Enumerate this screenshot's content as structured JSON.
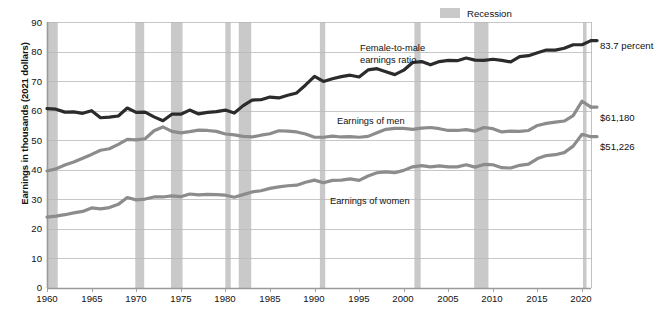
{
  "chart_data": {
    "type": "line",
    "title": "",
    "xlabel": "",
    "ylabel": "Earnings in thousands (2021 dollars)",
    "xlim": [
      1960,
      2021
    ],
    "ylim": [
      0,
      90
    ],
    "ytick_step": 10,
    "xtick_step": 5,
    "grid": true,
    "legend_position": "top-center",
    "yticks": [
      "0",
      "10",
      "20",
      "30",
      "40",
      "50",
      "60",
      "70",
      "80",
      "90"
    ],
    "xticks": [
      "1960",
      "1965",
      "1970",
      "1975",
      "1980",
      "1985",
      "1990",
      "1995",
      "2000",
      "2005",
      "2010",
      "2015",
      "2020"
    ],
    "legend": [
      {
        "label": "Recession",
        "color": "#c9c9c9",
        "kind": "band"
      }
    ],
    "annotations": [
      {
        "text_line1": "Female-to-male",
        "text_line2": "earnings ratio",
        "series": "ratio"
      },
      {
        "text_line1": "Earnings of men",
        "text_line2": "",
        "series": "men"
      },
      {
        "text_line1": "Earnings of women",
        "text_line2": "",
        "series": "women"
      }
    ],
    "end_labels": [
      {
        "text": "83.7 percent",
        "series": "ratio",
        "value": 83.7
      },
      {
        "text": "$61,180",
        "series": "men",
        "value": 61.18
      },
      {
        "text": "$51,226",
        "series": "women",
        "value": 51.226
      }
    ],
    "recessions": [
      [
        1960.0,
        1961.2
      ],
      [
        1969.9,
        1970.9
      ],
      [
        1973.9,
        1975.2
      ],
      [
        1980.0,
        1980.6
      ],
      [
        1981.5,
        1982.9
      ],
      [
        1990.6,
        1991.2
      ],
      [
        2001.2,
        2001.9
      ],
      [
        2007.9,
        2009.5
      ],
      [
        2020.1,
        2020.5
      ]
    ],
    "x": [
      1960,
      1961,
      1962,
      1963,
      1964,
      1965,
      1966,
      1967,
      1968,
      1969,
      1970,
      1971,
      1972,
      1973,
      1974,
      1975,
      1976,
      1977,
      1978,
      1979,
      1980,
      1981,
      1982,
      1983,
      1984,
      1985,
      1986,
      1987,
      1988,
      1989,
      1990,
      1991,
      1992,
      1993,
      1994,
      1995,
      1996,
      1997,
      1998,
      1999,
      2000,
      2001,
      2002,
      2003,
      2004,
      2005,
      2006,
      2007,
      2008,
      2009,
      2010,
      2011,
      2012,
      2013,
      2014,
      2015,
      2016,
      2017,
      2018,
      2019,
      2020,
      2021
    ],
    "series": [
      {
        "name": "Female-to-male earnings ratio",
        "units": "percent",
        "color": "#2b2b2b",
        "linewidth": 3.2,
        "values": [
          60.7,
          60.5,
          59.5,
          59.6,
          59.1,
          60.0,
          57.6,
          57.8,
          58.2,
          60.9,
          59.4,
          59.5,
          57.9,
          56.6,
          58.8,
          58.8,
          60.2,
          58.9,
          59.4,
          59.7,
          60.2,
          59.2,
          61.7,
          63.6,
          63.7,
          64.6,
          64.3,
          65.2,
          66.0,
          68.7,
          71.6,
          69.9,
          70.8,
          71.5,
          72.0,
          71.4,
          73.8,
          74.2,
          73.2,
          72.2,
          73.7,
          76.3,
          76.6,
          75.5,
          76.6,
          77.0,
          76.9,
          77.8,
          77.1,
          77.0,
          77.4,
          77.0,
          76.5,
          78.3,
          78.6,
          79.6,
          80.5,
          80.5,
          81.1,
          82.3,
          82.3,
          83.7
        ]
      },
      {
        "name": "Earnings of men",
        "units": "thousands of 2021 dollars",
        "color": "#8c8c8c",
        "linewidth": 3.2,
        "values": [
          39.6,
          40.3,
          41.6,
          42.6,
          43.9,
          45.2,
          46.6,
          47.1,
          48.6,
          50.3,
          50.1,
          50.5,
          53.2,
          54.5,
          53.0,
          52.5,
          52.9,
          53.4,
          53.3,
          53.0,
          52.1,
          51.8,
          51.3,
          51.1,
          51.7,
          52.2,
          53.2,
          53.1,
          52.8,
          52.1,
          51.0,
          51.0,
          51.4,
          51.1,
          51.2,
          51.0,
          51.3,
          52.5,
          53.7,
          54.0,
          54.0,
          53.7,
          54.1,
          54.3,
          53.9,
          53.3,
          53.3,
          53.6,
          53.1,
          54.3,
          53.9,
          52.8,
          53.1,
          53.0,
          53.3,
          55.0,
          55.7,
          56.1,
          56.5,
          58.3,
          63.2,
          61.2
        ]
      },
      {
        "name": "Earnings of women",
        "units": "thousands of 2021 dollars",
        "color": "#8c8c8c",
        "linewidth": 3.2,
        "values": [
          24.0,
          24.3,
          24.8,
          25.4,
          25.9,
          27.1,
          26.8,
          27.2,
          28.3,
          30.6,
          29.8,
          30.1,
          30.8,
          30.8,
          31.2,
          30.9,
          31.8,
          31.5,
          31.7,
          31.6,
          31.4,
          30.7,
          31.6,
          32.5,
          32.9,
          33.7,
          34.2,
          34.6,
          34.8,
          35.8,
          36.5,
          35.6,
          36.4,
          36.5,
          36.9,
          36.4,
          37.9,
          39.0,
          39.3,
          39.0,
          39.8,
          41.0,
          41.4,
          41.0,
          41.3,
          41.0,
          41.0,
          41.7,
          40.9,
          41.8,
          41.7,
          40.7,
          40.6,
          41.5,
          41.9,
          43.8,
          44.8,
          45.1,
          45.8,
          48.0,
          52.0,
          51.2
        ]
      }
    ]
  },
  "labels": {
    "recession_legend": "Recession",
    "ratio_anno_1": "Female-to-male",
    "ratio_anno_2": "earnings ratio",
    "men_anno": "Earnings of men",
    "women_anno": "Earnings of women",
    "end_ratio": "83.7 percent",
    "end_men": "$61,180",
    "end_women": "$51,226",
    "yaxis_title": "Earnings in thousands (2021 dollars)",
    "y0": "0",
    "y10": "10",
    "y20": "20",
    "y30": "30",
    "y40": "40",
    "y50": "50",
    "y60": "60",
    "y70": "70",
    "y80": "80",
    "y90": "90",
    "x1960": "1960",
    "x1965": "1965",
    "x1970": "1970",
    "x1975": "1975",
    "x1980": "1980",
    "x1985": "1985",
    "x1990": "1990",
    "x1995": "1995",
    "x2000": "2000",
    "x2005": "2005",
    "x2010": "2010",
    "x2015": "2015",
    "x2020": "2020"
  }
}
